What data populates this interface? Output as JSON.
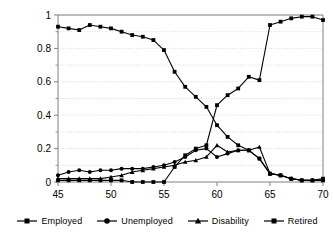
{
  "chart_data": {
    "type": "line",
    "title": "",
    "subtitle": "",
    "xlabel": "",
    "ylabel": "",
    "xlim": [
      45,
      70
    ],
    "ylim": [
      0,
      1
    ],
    "xticks": [
      45,
      50,
      55,
      60,
      65,
      70
    ],
    "xtick_labels": [
      "45",
      "50",
      "55",
      "60",
      "65",
      "70"
    ],
    "yticks": [
      0,
      0.2,
      0.4,
      0.6,
      0.8,
      1
    ],
    "ytick_labels": [
      "0",
      "0.2",
      "0.4",
      "0.6",
      "0.8",
      "1"
    ],
    "yminor_ticks": [
      0.1,
      0.3,
      0.5,
      0.7,
      0.9
    ],
    "grid": "horizontal-dotted",
    "legend_position": "bottom",
    "x": [
      45,
      46,
      47,
      48,
      49,
      50,
      51,
      52,
      53,
      54,
      55,
      56,
      57,
      58,
      59,
      60,
      61,
      62,
      63,
      64,
      65,
      66,
      67,
      68,
      69,
      70
    ],
    "series": [
      {
        "name": "Employed",
        "marker": "square",
        "color": "#000000",
        "values": [
          0.93,
          0.92,
          0.91,
          0.94,
          0.93,
          0.92,
          0.9,
          0.88,
          0.87,
          0.85,
          0.79,
          0.66,
          0.57,
          0.51,
          0.45,
          0.34,
          0.27,
          0.22,
          0.19,
          0.14,
          0.05,
          0.04,
          0.02,
          0.01,
          0.01,
          0.02
        ]
      },
      {
        "name": "Unemployed",
        "marker": "circle",
        "color": "#000000",
        "values": [
          0.04,
          0.06,
          0.07,
          0.06,
          0.07,
          0.07,
          0.08,
          0.08,
          0.08,
          0.09,
          0.1,
          0.12,
          0.15,
          0.19,
          0.2,
          0.15,
          0.17,
          0.19,
          0.19,
          0.14,
          0.05,
          0.04,
          0.02,
          0.01,
          0.01,
          0.01
        ]
      },
      {
        "name": "Disability",
        "marker": "triangle",
        "color": "#000000",
        "values": [
          0.02,
          0.02,
          0.02,
          0.02,
          0.02,
          0.03,
          0.04,
          0.06,
          0.07,
          0.08,
          0.09,
          0.1,
          0.12,
          0.13,
          0.15,
          0.22,
          0.18,
          0.19,
          0.19,
          0.21,
          0.05,
          0.04,
          0.02,
          0.01,
          0.01,
          0.01
        ]
      },
      {
        "name": "Retired",
        "marker": "square",
        "color": "#000000",
        "values": [
          0.01,
          0.01,
          0.01,
          0.01,
          0.01,
          0.01,
          0.01,
          0.0,
          0.0,
          0.0,
          0.0,
          0.09,
          0.16,
          0.2,
          0.22,
          0.46,
          0.52,
          0.56,
          0.63,
          0.61,
          0.94,
          0.96,
          0.98,
          0.99,
          0.99,
          0.97
        ]
      }
    ]
  },
  "legend": {
    "items": [
      {
        "label": "Employed",
        "marker": "square"
      },
      {
        "label": "Unemployed",
        "marker": "circle"
      },
      {
        "label": "Disability",
        "marker": "triangle"
      },
      {
        "label": "Retired",
        "marker": "square"
      }
    ]
  },
  "colors": {
    "ink": "#000000",
    "axis": "#808080",
    "grid": "#c8c8c8",
    "background": "#ffffff"
  }
}
